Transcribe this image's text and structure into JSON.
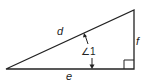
{
  "diagram": {
    "type": "right-triangle",
    "labels": {
      "hypotenuse": "d",
      "base": "e",
      "vertical_side": "f",
      "angle": "∠1"
    },
    "right_angle_marker": true,
    "colors": {
      "stroke": "#222222",
      "background": "#ffffff"
    }
  }
}
